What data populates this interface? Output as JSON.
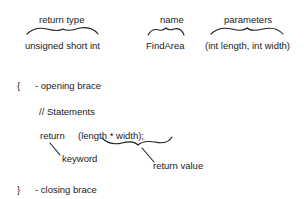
{
  "header_labels": {
    "return_type": "return type",
    "name": "name",
    "parameters": "parameters"
  },
  "header_values": {
    "return_type": "unsigned short int",
    "name": "FindArea",
    "parameters": "(int length, int width)"
  },
  "body": {
    "open_brace": "{",
    "open_brace_label": "- opening brace",
    "statements_comment": "// Statements",
    "return_keyword": "return",
    "return_expression": "(length * width);",
    "keyword_label": "keyword",
    "return_value_label": "return value",
    "close_brace": "}",
    "close_brace_label": "- closing brace"
  }
}
